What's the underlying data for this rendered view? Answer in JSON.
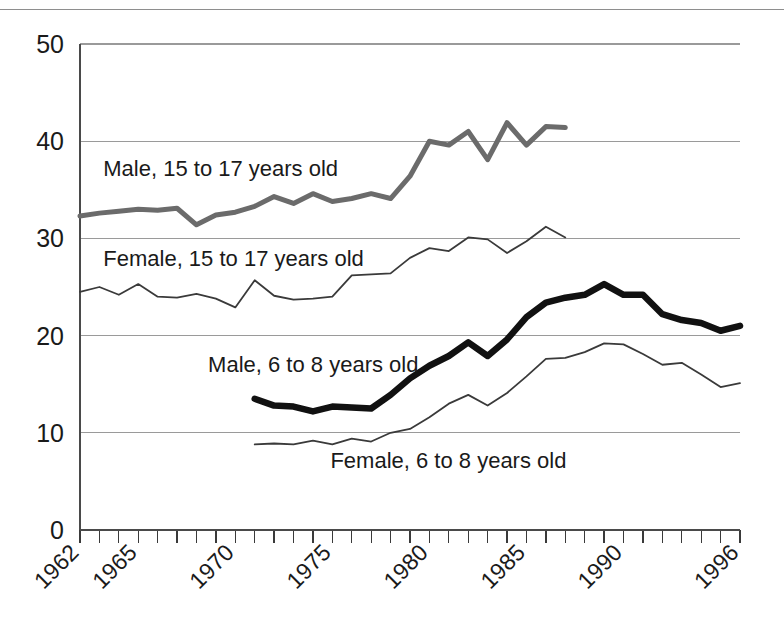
{
  "figure": {
    "background_color": "#ffffff",
    "top_rule": true
  },
  "chart_data": {
    "type": "line",
    "title": "",
    "subtitle": "",
    "xlabel": "",
    "ylabel": "",
    "xlim": [
      1962,
      1996
    ],
    "ylim": [
      0,
      50
    ],
    "grid": "horizontal",
    "legend_position": "inline-labels",
    "y_ticks": [
      0,
      10,
      20,
      30,
      40,
      50
    ],
    "y_tick_labels": [
      "0",
      "10",
      "20",
      "30",
      "40",
      "50"
    ],
    "x_ticks": [
      1962,
      1965,
      1970,
      1975,
      1980,
      1985,
      1990,
      1996
    ],
    "x_tick_labels": [
      "1962",
      "1965",
      "1970",
      "1975",
      "1980",
      "1985",
      "1990",
      "1996"
    ],
    "x_minor_tick_step": 1,
    "series": [
      {
        "name": "Male, 15 to 17 years old",
        "label": "Male, 15 to 17 years old",
        "color": "#6b6b6b",
        "line_width": 5,
        "label_x": 1963.2,
        "label_y": 36.4,
        "x": [
          1962,
          1963,
          1964,
          1965,
          1966,
          1967,
          1968,
          1969,
          1970,
          1971,
          1972,
          1973,
          1974,
          1975,
          1976,
          1977,
          1978,
          1979,
          1980,
          1981,
          1982,
          1983,
          1984,
          1985,
          1986,
          1987
        ],
        "values": [
          32.3,
          32.6,
          32.8,
          33.0,
          32.9,
          33.1,
          31.4,
          32.4,
          32.7,
          33.3,
          34.3,
          33.6,
          34.6,
          33.8,
          34.1,
          34.6,
          34.1,
          36.4,
          40.0,
          39.6,
          41.0,
          38.1,
          41.9,
          39.6,
          41.5,
          41.4
        ]
      },
      {
        "name": "Female, 15 to 17 years old",
        "label": "Female, 15 to 17 years old",
        "color": "#3a3a3a",
        "line_width": 1.8,
        "label_x": 1963.2,
        "label_y": 27.2,
        "x": [
          1962,
          1963,
          1964,
          1965,
          1966,
          1967,
          1968,
          1969,
          1970,
          1971,
          1972,
          1973,
          1974,
          1975,
          1976,
          1977,
          1978,
          1979,
          1980,
          1981,
          1982,
          1983,
          1984,
          1985,
          1986,
          1987
        ],
        "values": [
          24.5,
          25.0,
          24.2,
          25.3,
          24.0,
          23.9,
          24.3,
          23.8,
          22.9,
          25.7,
          24.1,
          23.7,
          23.8,
          24.0,
          26.2,
          26.3,
          26.4,
          28.0,
          29.0,
          28.7,
          30.1,
          29.9,
          28.5,
          29.7,
          31.2,
          30.1
        ]
      },
      {
        "name": "Male, 6 to 8 years old",
        "label": "Male, 6 to 8 years old",
        "color": "#111111",
        "line_width": 6.5,
        "label_x": 1968.6,
        "label_y": 16.3,
        "x": [
          1971,
          1972,
          1973,
          1974,
          1975,
          1976,
          1977,
          1978,
          1979,
          1980,
          1981,
          1982,
          1983,
          1984,
          1985,
          1986,
          1987,
          1988,
          1989,
          1990,
          1991,
          1992,
          1993,
          1994,
          1995,
          1996
        ],
        "values": [
          13.5,
          12.8,
          12.7,
          12.2,
          12.7,
          12.6,
          12.5,
          13.9,
          15.6,
          16.9,
          17.9,
          19.3,
          17.9,
          19.6,
          21.9,
          23.4,
          23.9,
          24.2,
          25.3,
          24.2,
          24.2,
          22.2,
          21.6,
          21.3,
          20.5,
          21.0
        ]
      },
      {
        "name": "Female, 6 to 8 years old",
        "label": "Female, 6 to 8 years old",
        "color": "#3a3a3a",
        "line_width": 1.8,
        "label_x": 1974.9,
        "label_y": 6.4,
        "x": [
          1971,
          1972,
          1973,
          1974,
          1975,
          1976,
          1977,
          1978,
          1979,
          1980,
          1981,
          1982,
          1983,
          1984,
          1985,
          1986,
          1987,
          1988,
          1989,
          1990,
          1991,
          1992,
          1993,
          1994,
          1995,
          1996
        ],
        "values": [
          8.8,
          8.9,
          8.8,
          9.2,
          8.8,
          9.4,
          9.1,
          10.0,
          10.4,
          11.6,
          13.0,
          13.9,
          12.8,
          14.1,
          15.8,
          17.6,
          17.7,
          18.3,
          19.2,
          19.1,
          18.1,
          17.0,
          17.2,
          16.0,
          14.7,
          15.1
        ]
      }
    ]
  }
}
